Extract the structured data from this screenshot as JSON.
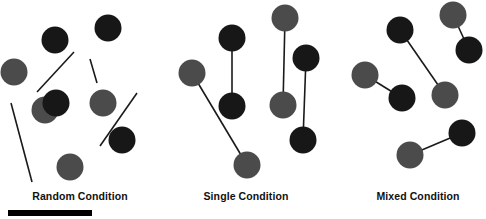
{
  "figure": {
    "width": 486,
    "height": 219,
    "background_color": "#ffffff",
    "dark_dot_color": "#171717",
    "gray_dot_color": "#4b4b4b",
    "line_color": "#1a1a1a",
    "dot_radius": 13.5,
    "line_width": 1.6
  },
  "labels": {
    "random": "Random Condition",
    "single": "Single Condition",
    "mixed": "Mixed Condition"
  },
  "scale_bar": {
    "x": 8,
    "y": 210,
    "width": 84,
    "height": 6,
    "color": "#000000"
  },
  "chart_data": {
    "type": "scatter",
    "title": "",
    "xlabel": "",
    "ylabel": "",
    "panels": [
      {
        "name": "random",
        "label": "Random Condition",
        "label_x": 80,
        "label_y": 190,
        "dots": [
          {
            "id": "r1",
            "x": 45,
            "y": 110,
            "shade": "gray"
          },
          {
            "id": "r2",
            "x": 108,
            "y": 28,
            "shade": "dark"
          },
          {
            "id": "r3",
            "x": 14,
            "y": 72,
            "shade": "gray"
          },
          {
            "id": "r4",
            "x": 55,
            "y": 40,
            "shade": "dark"
          },
          {
            "id": "r5",
            "x": 56,
            "y": 103,
            "shade": "dark"
          },
          {
            "id": "r6",
            "x": 103,
            "y": 103,
            "shade": "gray"
          },
          {
            "id": "r7",
            "x": 122,
            "y": 140,
            "shade": "dark"
          },
          {
            "id": "r8",
            "x": 70,
            "y": 167,
            "shade": "gray"
          }
        ],
        "lines": [
          {
            "id": "rl1",
            "x1": 37,
            "y1": 92,
            "x2": 74,
            "y2": 52
          },
          {
            "id": "rl2",
            "x1": 90,
            "y1": 59,
            "x2": 97,
            "y2": 83
          },
          {
            "id": "rl3",
            "x1": 11,
            "y1": 103,
            "x2": 32,
            "y2": 182
          },
          {
            "id": "rl4",
            "x1": 137,
            "y1": 93,
            "x2": 100,
            "y2": 146
          }
        ]
      },
      {
        "name": "single",
        "label": "Single Condition",
        "label_x": 246,
        "label_y": 190,
        "dots": [
          {
            "id": "s1",
            "x": 192,
            "y": 73,
            "shade": "gray"
          },
          {
            "id": "s2",
            "x": 232,
            "y": 38,
            "shade": "dark"
          },
          {
            "id": "s3",
            "x": 232,
            "y": 106,
            "shade": "dark"
          },
          {
            "id": "s4",
            "x": 247,
            "y": 165,
            "shade": "gray"
          },
          {
            "id": "s5",
            "x": 285,
            "y": 18,
            "shade": "gray"
          },
          {
            "id": "s6",
            "x": 283,
            "y": 105,
            "shade": "gray"
          },
          {
            "id": "s7",
            "x": 306,
            "y": 58,
            "shade": "dark"
          },
          {
            "id": "s8",
            "x": 303,
            "y": 140,
            "shade": "dark"
          }
        ],
        "pairs": [
          {
            "id": "sp1",
            "from": "s2",
            "to": "s3",
            "type": "dark-dark"
          },
          {
            "id": "sp2",
            "from": "s1",
            "to": "s4",
            "type": "gray-gray"
          },
          {
            "id": "sp3",
            "from": "s5",
            "to": "s6",
            "type": "gray-gray"
          },
          {
            "id": "sp4",
            "from": "s7",
            "to": "s8",
            "type": "dark-dark"
          }
        ]
      },
      {
        "name": "mixed",
        "label": "Mixed Condition",
        "label_x": 418,
        "label_y": 190,
        "dots": [
          {
            "id": "m1",
            "x": 365,
            "y": 75,
            "shade": "gray"
          },
          {
            "id": "m2",
            "x": 402,
            "y": 98,
            "shade": "dark"
          },
          {
            "id": "m3",
            "x": 400,
            "y": 30,
            "shade": "dark"
          },
          {
            "id": "m4",
            "x": 445,
            "y": 95,
            "shade": "gray"
          },
          {
            "id": "m5",
            "x": 453,
            "y": 15,
            "shade": "gray"
          },
          {
            "id": "m6",
            "x": 469,
            "y": 50,
            "shade": "dark"
          },
          {
            "id": "m7",
            "x": 410,
            "y": 155,
            "shade": "gray"
          },
          {
            "id": "m8",
            "x": 462,
            "y": 133,
            "shade": "dark"
          }
        ],
        "pairs": [
          {
            "id": "mp1",
            "from": "m1",
            "to": "m2",
            "type": "gray-dark"
          },
          {
            "id": "mp2",
            "from": "m3",
            "to": "m4",
            "type": "dark-gray"
          },
          {
            "id": "mp3",
            "from": "m5",
            "to": "m6",
            "type": "gray-dark"
          },
          {
            "id": "mp4",
            "from": "m7",
            "to": "m8",
            "type": "gray-dark"
          }
        ]
      }
    ]
  }
}
